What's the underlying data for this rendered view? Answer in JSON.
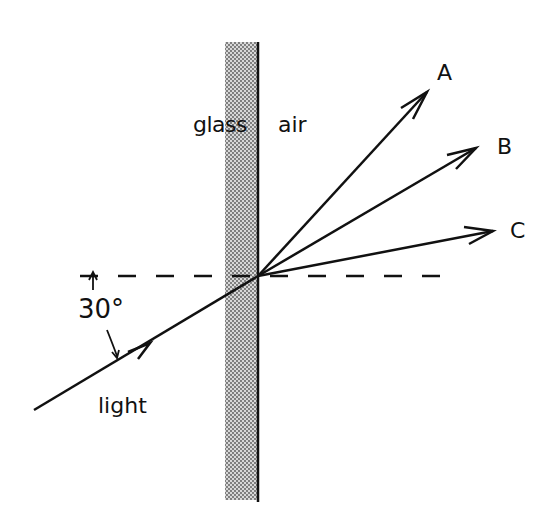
{
  "diagram": {
    "media": {
      "left": "glass",
      "right": "air"
    },
    "incident_ray": {
      "label": "light",
      "angle_label": "30°",
      "angle_reference": "horizontal dashed normal line"
    },
    "refracted_rays": [
      {
        "label": "A"
      },
      {
        "label": "B"
      },
      {
        "label": "C"
      }
    ],
    "colors": {
      "ink": "#111111",
      "glass_fill": "#b8b8b8",
      "background": "#ffffff"
    }
  }
}
